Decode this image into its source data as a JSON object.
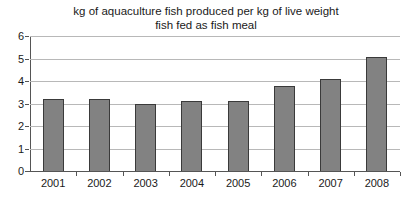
{
  "chart_data": {
    "type": "bar",
    "title_line1": "kg of aquaculture fish produced per kg of live weight",
    "title_line2": "fish fed as fish meal",
    "categories": [
      "2001",
      "2002",
      "2003",
      "2004",
      "2005",
      "2006",
      "2007",
      "2008"
    ],
    "values": [
      3.2,
      3.2,
      3.0,
      3.1,
      3.1,
      3.8,
      4.1,
      5.05
    ],
    "xlabel": "",
    "ylabel": "",
    "ylim": [
      0,
      6
    ],
    "ytick_step": 1,
    "yticks": [
      0,
      1,
      2,
      3,
      4,
      5,
      6
    ],
    "grid": "horizontal",
    "legend": "none",
    "colors": {
      "bar_fill": "#828282",
      "bar_border": "#3a3a3a",
      "gridline": "#b8b8b8",
      "axis": "#555555",
      "text": "#1a1a1a",
      "background": "#ffffff"
    }
  }
}
